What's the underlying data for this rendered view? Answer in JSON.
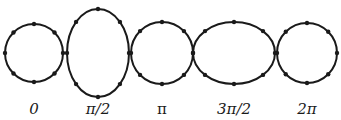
{
  "diagram": {
    "stroke_color": "#1a1a1a",
    "background": "#ffffff",
    "shapes": [
      {
        "type": "circle",
        "cx": 34,
        "cy": 53,
        "rx": 29,
        "ry": 29,
        "label": "0"
      },
      {
        "type": "ellipse",
        "cx": 98,
        "cy": 53,
        "rx": 31,
        "ry": 44,
        "label": "π/2"
      },
      {
        "type": "circle",
        "cx": 162,
        "cy": 53,
        "rx": 31,
        "ry": 31,
        "label": "π"
      },
      {
        "type": "ellipse",
        "cx": 234,
        "cy": 53,
        "rx": 41,
        "ry": 31,
        "label": "3π/2"
      },
      {
        "type": "circle",
        "cx": 307,
        "cy": 53,
        "rx": 30,
        "ry": 30,
        "label": "2π"
      }
    ],
    "dots_per_shape": 8
  }
}
